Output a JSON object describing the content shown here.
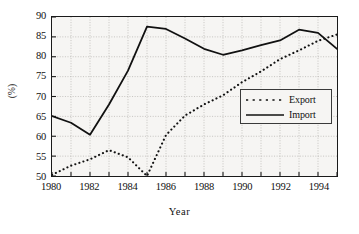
{
  "chart_data": {
    "type": "line",
    "title": "",
    "xlabel": "Year",
    "ylabel": "(%)",
    "xlim": [
      1980,
      1995
    ],
    "ylim": [
      50,
      90
    ],
    "ytick_step": 5,
    "xtick_step": 2,
    "grid": true,
    "grid_minor_x": true,
    "legend_position": "center-right",
    "x": [
      1980,
      1981,
      1982,
      1983,
      1984,
      1985,
      1986,
      1987,
      1988,
      1989,
      1990,
      1991,
      1992,
      1993,
      1994,
      1995
    ],
    "series": [
      {
        "name": "Export",
        "style": "dotted",
        "color": "#111111",
        "values": [
          50.3,
          52.6,
          54.2,
          56.5,
          54.7,
          50.0,
          60.3,
          65.2,
          68.0,
          70.3,
          73.6,
          76.3,
          79.4,
          81.6,
          84.0,
          85.6
        ]
      },
      {
        "name": "Import",
        "style": "solid",
        "color": "#111111",
        "values": [
          65.1,
          63.4,
          60.4,
          68.0,
          76.5,
          87.6,
          87.0,
          84.6,
          82.0,
          80.5,
          81.6,
          82.9,
          84.1,
          86.8,
          86.0,
          82.0
        ]
      }
    ],
    "ytick_labels": [
      "90",
      "85",
      "80",
      "75",
      "70",
      "65",
      "60",
      "55",
      "50"
    ],
    "ytick_values": [
      90,
      85,
      80,
      75,
      70,
      65,
      60,
      55,
      50
    ],
    "xtick_labels": [
      "1980",
      "1982",
      "1984",
      "1986",
      "1988",
      "1990",
      "1992",
      "1994"
    ],
    "xtick_values": [
      1980,
      1982,
      1984,
      1986,
      1988,
      1990,
      1992,
      1994
    ]
  },
  "legend": {
    "entries": [
      {
        "label": "Export"
      },
      {
        "label": "Import"
      }
    ]
  },
  "colors": {
    "line": "#111111",
    "axis": "#1a1a1a",
    "grid": "#b9b7b3",
    "plot_background": "#f6f5f3",
    "page_background": "#ffffff"
  }
}
